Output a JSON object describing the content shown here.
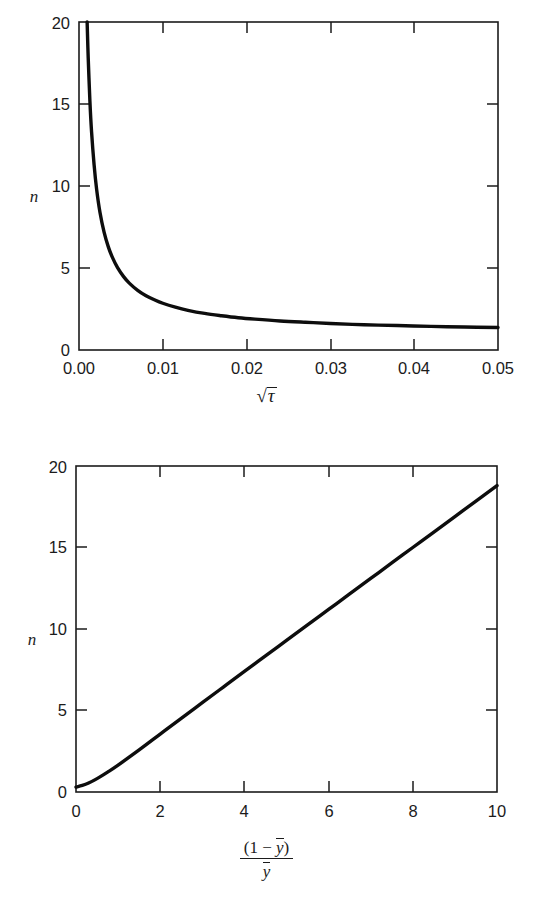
{
  "page": {
    "background": "#ffffff",
    "ink": "#1b1b1b",
    "curve_color": "#0d0d0d"
  },
  "chart_data": [
    {
      "id": "top",
      "type": "line",
      "title": "",
      "xlabel": "√τ",
      "xlabel_parts": {
        "radical_sign": "√",
        "radicand": "τ"
      },
      "ylabel": "n",
      "xlim": [
        0,
        0.05
      ],
      "ylim": [
        0,
        20
      ],
      "grid": false,
      "legend": "none",
      "xticks": [
        0,
        0.01,
        0.02,
        0.03,
        0.04,
        0.05
      ],
      "xticklabels": [
        "0.00",
        "0.01",
        "0.02",
        "0.03",
        "0.04",
        "0.05"
      ],
      "yticks": [
        0,
        5,
        10,
        15,
        20
      ],
      "yticklabels": [
        "0",
        "5",
        "10",
        "15",
        "20"
      ],
      "series": [
        {
          "name": "n vs sqrt(tau)",
          "x": [
            0.00097,
            0.0011,
            0.0013,
            0.0015,
            0.0018,
            0.0021,
            0.0025,
            0.003,
            0.0035,
            0.004,
            0.0046,
            0.0053,
            0.006,
            0.007,
            0.008,
            0.009,
            0.01,
            0.0115,
            0.013,
            0.015,
            0.017,
            0.019,
            0.021,
            0.024,
            0.027,
            0.03,
            0.034,
            0.038,
            0.042,
            0.046,
            0.05
          ],
          "y": [
            20.0,
            17.8,
            15.2,
            13.3,
            11.3,
            9.81,
            8.4,
            7.17,
            6.29,
            5.63,
            5.02,
            4.49,
            4.08,
            3.64,
            3.31,
            3.06,
            2.85,
            2.61,
            2.42,
            2.23,
            2.09,
            1.97,
            1.88,
            1.77,
            1.69,
            1.62,
            1.54,
            1.49,
            1.44,
            1.4,
            1.37
          ]
        }
      ]
    },
    {
      "id": "bottom",
      "type": "line",
      "title": "",
      "xlabel": "(1 − ȳ) / ȳ",
      "xlabel_parts": {
        "numerator_open": "(1 − ",
        "numerator_var": "y",
        "numerator_close": ")",
        "denominator_var": "y"
      },
      "ylabel": "n",
      "xlim": [
        0,
        10
      ],
      "ylim": [
        0,
        20
      ],
      "grid": false,
      "legend": "none",
      "xticks": [
        0,
        2,
        4,
        6,
        8,
        10
      ],
      "xticklabels": [
        "0",
        "2",
        "4",
        "6",
        "8",
        "10"
      ],
      "yticks": [
        0,
        5,
        10,
        15,
        20
      ],
      "yticklabels": [
        "0",
        "5",
        "10",
        "15",
        "20"
      ],
      "series": [
        {
          "name": "n vs (1-ybar)/ybar",
          "x": [
            0.0,
            0.15,
            0.3,
            0.5,
            0.75,
            1.0,
            1.5,
            2.0,
            2.5,
            3.0,
            3.5,
            4.0,
            4.5,
            5.0,
            5.5,
            6.0,
            6.5,
            7.0,
            7.5,
            8.0,
            8.5,
            9.0,
            9.5,
            10.0
          ],
          "y": [
            0.3,
            0.4,
            0.55,
            0.82,
            1.22,
            1.65,
            2.58,
            3.55,
            4.52,
            5.48,
            6.44,
            7.4,
            8.35,
            9.3,
            10.25,
            11.2,
            12.15,
            13.1,
            14.05,
            15.0,
            15.95,
            16.9,
            17.85,
            18.8
          ]
        }
      ]
    }
  ]
}
